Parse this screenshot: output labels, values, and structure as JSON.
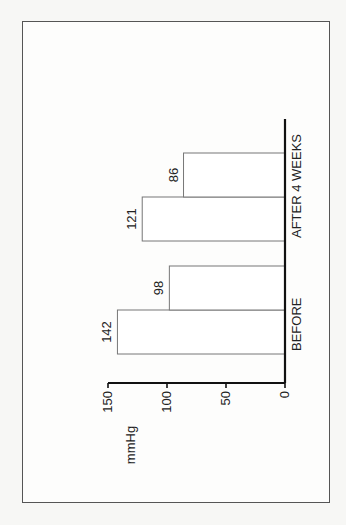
{
  "chart_data": {
    "type": "bar",
    "orientation": "rotated-90-ccw",
    "title": "",
    "xlabel": "",
    "ylabel": "mmHg",
    "ylim": [
      0,
      150
    ],
    "yticks": [
      0,
      50,
      100,
      150
    ],
    "ytick_labels": [
      "0",
      "50",
      "100",
      "150"
    ],
    "grid": false,
    "legend": "none",
    "groups": [
      {
        "label": "BEFORE",
        "values": [
          142,
          98
        ],
        "value_labels": [
          "142",
          "98"
        ]
      },
      {
        "label": "AFTER 4 WEEKS",
        "values": [
          121,
          86
        ],
        "value_labels": [
          "121",
          "86"
        ]
      }
    ]
  }
}
